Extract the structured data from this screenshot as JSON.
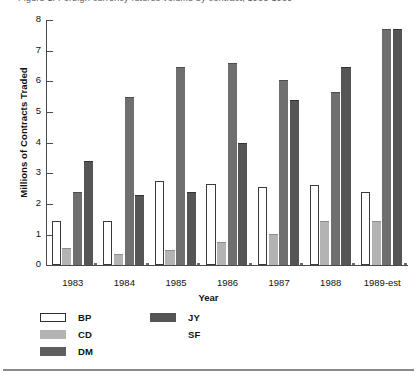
{
  "figure": {
    "caption_clipped": "Figure 1. Foreign currency futures volume by contract, 1983-1989",
    "bottom_rule": true
  },
  "chart_data": {
    "type": "bar",
    "title": "",
    "subtitle": "",
    "xlabel": "Year",
    "ylabel": "Millions of Contracts Traded",
    "categories": [
      "1983",
      "1984",
      "1985",
      "1986",
      "1987",
      "1988",
      "1989-est"
    ],
    "ylim": [
      0,
      8
    ],
    "yticks": [
      0,
      1,
      2,
      3,
      4,
      5,
      6,
      7,
      8
    ],
    "ytick_labels": [
      "0",
      "1",
      "2",
      "3",
      "4",
      "5",
      "6",
      "7",
      "8"
    ],
    "grid": false,
    "legend_position": "below-left",
    "series": [
      {
        "name": "BP",
        "color": "#ffffff",
        "values": [
          1.45,
          1.45,
          2.75,
          2.65,
          2.55,
          2.6,
          2.4
        ]
      },
      {
        "name": "CD",
        "color": "#b3b3b3",
        "values": [
          0.55,
          0.35,
          0.5,
          0.75,
          1.0,
          1.45,
          1.45
        ]
      },
      {
        "name": "DM",
        "color": "#6f6f6f",
        "values": [
          2.4,
          5.5,
          6.45,
          6.6,
          6.05,
          5.65,
          7.7
        ]
      },
      {
        "name": "JY",
        "color": "#555555",
        "values": [
          3.4,
          2.3,
          2.4,
          4.0,
          5.4,
          6.45,
          7.7
        ]
      },
      {
        "name": "SF",
        "color": "#ffffff",
        "values": [
          0.05,
          0.05,
          0.05,
          0.05,
          0.05,
          0.05,
          0.05
        ]
      }
    ]
  },
  "legend": {
    "column_1": [
      {
        "label": "BP",
        "swatch": "bp"
      },
      {
        "label": "CD",
        "swatch": "cd"
      },
      {
        "label": "DM",
        "swatch": "dm"
      }
    ],
    "column_2": [
      {
        "label": "JY",
        "swatch": "jy"
      },
      {
        "label": "SF",
        "swatch": "sf"
      }
    ]
  }
}
